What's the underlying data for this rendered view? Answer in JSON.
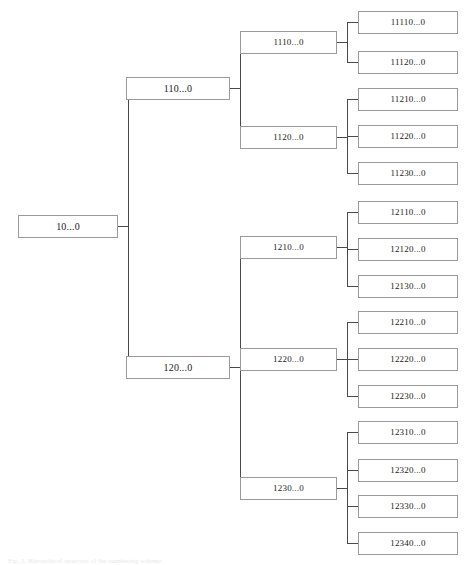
{
  "figure": {
    "type": "tree-diagram",
    "orientation": "left-to-right",
    "background_color": "#ffffff",
    "node_border_color": "#9a9a9a",
    "node_fill_color": "#ffffff",
    "connector_color": "#4a4a4a",
    "text_color": "#1b1b1b",
    "caption": "Fig. 2. Hierarchical structure of the numbering scheme."
  },
  "tree": {
    "root": {
      "id": "root",
      "label": "10...0",
      "x": 18,
      "y": 215,
      "w": 100,
      "h": 23,
      "font_size": 10
    },
    "level1": [
      {
        "id": "n110",
        "label": "110...0",
        "x": 126,
        "y": 77,
        "w": 104,
        "h": 23,
        "font_size": 10
      },
      {
        "id": "n120",
        "label": "120...0",
        "x": 126,
        "y": 356,
        "w": 104,
        "h": 23,
        "font_size": 10
      }
    ],
    "level2": [
      {
        "id": "n1110",
        "label": "1110...0",
        "x": 240,
        "y": 31,
        "w": 97,
        "h": 23,
        "font_size": 9,
        "parent": "n110"
      },
      {
        "id": "n1120",
        "label": "1120...0",
        "x": 240,
        "y": 126,
        "w": 97,
        "h": 23,
        "font_size": 9,
        "parent": "n110"
      },
      {
        "id": "n1210",
        "label": "1210...0",
        "x": 240,
        "y": 236,
        "w": 97,
        "h": 23,
        "font_size": 9,
        "parent": "n120"
      },
      {
        "id": "n1220",
        "label": "1220...0",
        "x": 240,
        "y": 348,
        "w": 97,
        "h": 23,
        "font_size": 9,
        "parent": "n120"
      },
      {
        "id": "n1230",
        "label": "1230...0",
        "x": 240,
        "y": 477,
        "w": 97,
        "h": 23,
        "font_size": 9,
        "parent": "n120"
      }
    ],
    "level3": [
      {
        "id": "n11110",
        "label": "11110...0",
        "x": 358,
        "y": 11,
        "w": 100,
        "h": 23,
        "font_size": 9,
        "parent": "n1110"
      },
      {
        "id": "n11120",
        "label": "11120...0",
        "x": 358,
        "y": 51,
        "w": 100,
        "h": 23,
        "font_size": 9,
        "parent": "n1110"
      },
      {
        "id": "n11210",
        "label": "11210...0",
        "x": 358,
        "y": 88,
        "w": 100,
        "h": 23,
        "font_size": 9,
        "parent": "n1120"
      },
      {
        "id": "n11220",
        "label": "11220...0",
        "x": 358,
        "y": 125,
        "w": 100,
        "h": 23,
        "font_size": 9,
        "parent": "n1120"
      },
      {
        "id": "n11230",
        "label": "11230...0",
        "x": 358,
        "y": 162,
        "w": 100,
        "h": 23,
        "font_size": 9,
        "parent": "n1120"
      },
      {
        "id": "n12110",
        "label": "12110...0",
        "x": 358,
        "y": 201,
        "w": 100,
        "h": 23,
        "font_size": 9,
        "parent": "n1210"
      },
      {
        "id": "n12120",
        "label": "12120...0",
        "x": 358,
        "y": 238,
        "w": 100,
        "h": 23,
        "font_size": 9,
        "parent": "n1210"
      },
      {
        "id": "n12130",
        "label": "12130...0",
        "x": 358,
        "y": 275,
        "w": 100,
        "h": 23,
        "font_size": 9,
        "parent": "n1210"
      },
      {
        "id": "n12210",
        "label": "12210...0",
        "x": 358,
        "y": 311,
        "w": 100,
        "h": 23,
        "font_size": 9,
        "parent": "n1220"
      },
      {
        "id": "n12220",
        "label": "12220...0",
        "x": 358,
        "y": 348,
        "w": 100,
        "h": 23,
        "font_size": 9,
        "parent": "n1220"
      },
      {
        "id": "n12230",
        "label": "12230...0",
        "x": 358,
        "y": 385,
        "w": 100,
        "h": 23,
        "font_size": 9,
        "parent": "n1220"
      },
      {
        "id": "n12310",
        "label": "12310...0",
        "x": 358,
        "y": 421,
        "w": 100,
        "h": 23,
        "font_size": 9,
        "parent": "n1230"
      },
      {
        "id": "n12320",
        "label": "12320...0",
        "x": 358,
        "y": 459,
        "w": 100,
        "h": 23,
        "font_size": 9,
        "parent": "n1230"
      },
      {
        "id": "n12330",
        "label": "12330...0",
        "x": 358,
        "y": 495,
        "w": 100,
        "h": 23,
        "font_size": 9,
        "parent": "n1230"
      },
      {
        "id": "n12340",
        "label": "12340...0",
        "x": 358,
        "y": 532,
        "w": 100,
        "h": 23,
        "font_size": 9,
        "parent": "n1230"
      }
    ]
  }
}
